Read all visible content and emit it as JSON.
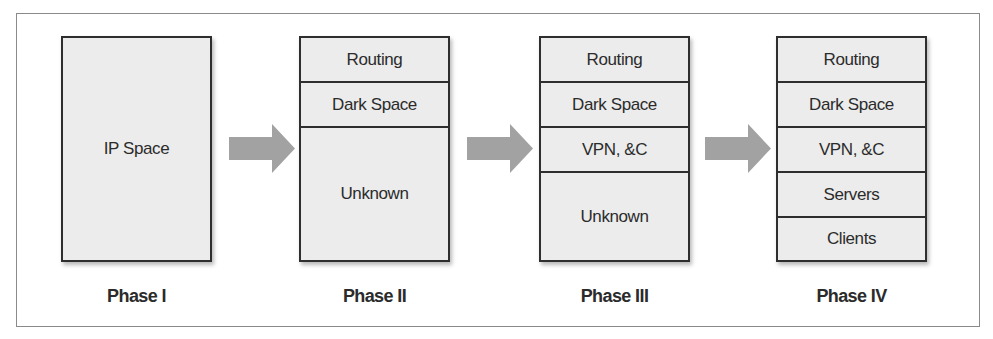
{
  "diagram": {
    "type": "phased-stack",
    "colors": {
      "frame_border": "#8a8a8a",
      "box_border": "#2e2e2e",
      "box_fill": "#ececec",
      "arrow": "#a2a2a2",
      "text": "#2b2b2b"
    },
    "phases": [
      {
        "label": "Phase I",
        "segments": [
          "IP Space"
        ]
      },
      {
        "label": "Phase II",
        "segments": [
          "Routing",
          "Dark Space",
          "Unknown"
        ]
      },
      {
        "label": "Phase III",
        "segments": [
          "Routing",
          "Dark Space",
          "VPN, &C",
          "Unknown"
        ]
      },
      {
        "label": "Phase IV",
        "segments": [
          "Routing",
          "Dark Space",
          "VPN, &C",
          "Servers",
          "Clients"
        ]
      }
    ]
  }
}
